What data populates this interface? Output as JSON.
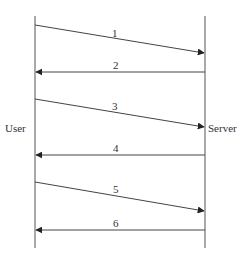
{
  "diagram": {
    "type": "sequence",
    "colors": {
      "line": "#444444",
      "text": "#333333",
      "background": "#ffffff"
    },
    "actors": [
      {
        "id": "user",
        "label": "User",
        "x": 35
      },
      {
        "id": "server",
        "label": "Server",
        "x": 205
      }
    ],
    "lifeline": {
      "top": 16,
      "bottom": 248
    },
    "messages": [
      {
        "label": "1",
        "from": "user",
        "to": "server",
        "y1": 25,
        "y2": 53
      },
      {
        "label": "2",
        "from": "server",
        "to": "user",
        "y1": 72,
        "y2": 72
      },
      {
        "label": "3",
        "from": "user",
        "to": "server",
        "y1": 99,
        "y2": 127
      },
      {
        "label": "4",
        "from": "server",
        "to": "user",
        "y1": 155,
        "y2": 155
      },
      {
        "label": "5",
        "from": "user",
        "to": "server",
        "y1": 182,
        "y2": 211
      },
      {
        "label": "6",
        "from": "server",
        "to": "user",
        "y1": 230,
        "y2": 230
      }
    ]
  }
}
